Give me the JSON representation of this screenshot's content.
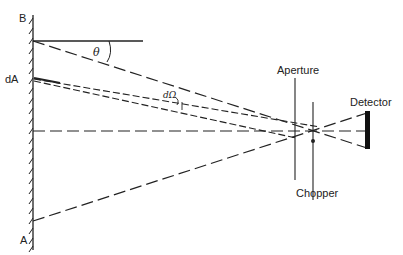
{
  "diagram": {
    "type": "optical-geometry",
    "labels": {
      "wall_top": "B",
      "wall_bottom": "A",
      "area_element": "dA",
      "angle": "θ",
      "solid_angle": "dΩ",
      "aperture": "Aperture",
      "chopper": "Chopper",
      "detector": "Detector"
    },
    "colors": {
      "line": "#222222",
      "background": "#ffffff"
    }
  }
}
